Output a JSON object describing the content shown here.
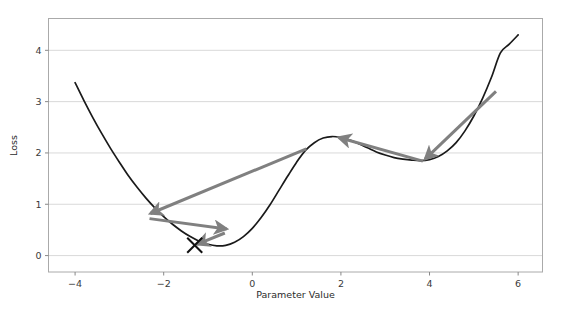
{
  "chart_data": {
    "type": "line",
    "title": "",
    "xlabel": "Parameter Value",
    "ylabel": "Loss",
    "xlim": [
      -4.6,
      6.55
    ],
    "ylim": [
      -0.32,
      4.62
    ],
    "xticks": [
      -4,
      -2,
      0,
      2,
      4,
      6
    ],
    "xtick_labels": [
      "−4",
      "−2",
      "0",
      "2",
      "4",
      "6"
    ],
    "yticks": [
      0,
      1,
      2,
      3,
      4
    ],
    "ytick_labels": [
      "0",
      "1",
      "2",
      "3",
      "4"
    ],
    "grid": "horizontal",
    "legend": "none",
    "curve_color": "#1a1a1a",
    "arrow_color": "#808080",
    "marker_color": "#111111",
    "grid_color": "#d9d9d9",
    "frame_color": "#aaaaaa",
    "background": "#ffffff",
    "series": [
      {
        "name": "Loss landscape",
        "x": [
          -4.0,
          -3.8,
          -3.6,
          -3.4,
          -3.2,
          -3.0,
          -2.8,
          -2.6,
          -2.4,
          -2.2,
          -2.0,
          -1.8,
          -1.6,
          -1.4,
          -1.2,
          -1.0,
          -0.8,
          -0.6,
          -0.4,
          -0.2,
          0.0,
          0.2,
          0.4,
          0.6,
          0.8,
          1.0,
          1.2,
          1.4,
          1.6,
          1.8,
          2.0,
          2.2,
          2.4,
          2.6,
          2.8,
          3.0,
          3.2,
          3.4,
          3.6,
          3.8,
          4.0,
          4.2,
          4.4,
          4.6,
          4.8,
          5.0,
          5.2,
          5.4,
          5.6,
          5.8,
          6.0
        ],
        "y": [
          3.37,
          3.02,
          2.69,
          2.38,
          2.09,
          1.82,
          1.56,
          1.33,
          1.12,
          0.93,
          0.76,
          0.61,
          0.48,
          0.37,
          0.28,
          0.22,
          0.19,
          0.2,
          0.26,
          0.37,
          0.53,
          0.74,
          0.99,
          1.27,
          1.55,
          1.82,
          2.05,
          2.2,
          2.29,
          2.32,
          2.3,
          2.25,
          2.18,
          2.1,
          2.02,
          1.96,
          1.91,
          1.88,
          1.86,
          1.85,
          1.87,
          1.93,
          2.04,
          2.2,
          2.43,
          2.72,
          3.07,
          3.48,
          3.95,
          4.12,
          4.3
        ]
      }
    ],
    "annotations": {
      "optimum_marker": {
        "shape": "x",
        "x": -1.3,
        "y": 0.2,
        "label": ""
      },
      "arrows": [
        {
          "name": "step-1-long-descent",
          "from": [
            1.22,
            2.08
          ],
          "to": [
            -2.3,
            0.82
          ]
        },
        {
          "name": "step-2-rightward",
          "from": [
            -2.32,
            0.72
          ],
          "to": [
            -0.58,
            0.52
          ]
        },
        {
          "name": "step-3-back-to-minimum",
          "from": [
            -0.62,
            0.44
          ],
          "to": [
            -1.25,
            0.22
          ]
        },
        {
          "name": "step-4-descent-from-right",
          "from": [
            5.5,
            3.2
          ],
          "to": [
            3.9,
            1.88
          ]
        },
        {
          "name": "step-5-leftward-to-peak",
          "from": [
            3.85,
            1.84
          ],
          "to": [
            1.95,
            2.3
          ]
        }
      ]
    }
  },
  "figure": {
    "ylabel": "Loss",
    "xlabel": "Parameter Value"
  }
}
